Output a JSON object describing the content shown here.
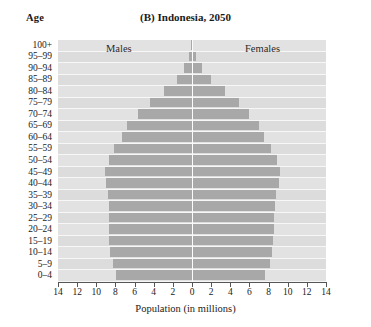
{
  "axes": {
    "age_label": "Age",
    "x_title": "Population (in millions)",
    "x_ticks": [
      "14",
      "12",
      "10",
      "8",
      "6",
      "4",
      "2",
      "0",
      "2",
      "4",
      "6",
      "8",
      "10",
      "12",
      "14"
    ]
  },
  "title": {
    "panel": "(B)",
    "text": "Indonesia, 2050",
    "full": "(B) Indonesia, 2050"
  },
  "legend": {
    "males": "Males",
    "females": "Females"
  },
  "colors": {
    "bar": "#a8a8a8",
    "plot_background": "#e2e2e2",
    "plot_background_alt": "#dcdcdc",
    "center_line": "#fbfbfb",
    "axis": "#555555",
    "text": "#1a1a1a"
  },
  "chart_data": {
    "type": "bar",
    "subtype": "population-pyramid",
    "xlabel": "Population (in millions)",
    "ylabel": "Age",
    "xlim": [
      -14,
      14
    ],
    "x_ticks_absolute": [
      14,
      12,
      10,
      8,
      6,
      4,
      2,
      0,
      2,
      4,
      6,
      8,
      10,
      12,
      14
    ],
    "grid": false,
    "legend_position": "inside-top",
    "categories": [
      "100+",
      "95–99",
      "90–94",
      "85–89",
      "80–84",
      "75–79",
      "70–74",
      "65–69",
      "60–64",
      "55–59",
      "50–54",
      "45–49",
      "40–44",
      "35–39",
      "30–34",
      "25–29",
      "20–24",
      "15–19",
      "10–14",
      "5–9",
      "0–4"
    ],
    "series": [
      {
        "name": "Males",
        "direction": "left",
        "values": [
          0.1,
          0.3,
          0.8,
          1.6,
          2.9,
          4.4,
          5.6,
          6.8,
          7.3,
          8.1,
          8.7,
          9.1,
          9.0,
          8.8,
          8.7,
          8.7,
          8.7,
          8.7,
          8.6,
          8.3,
          7.9
        ]
      },
      {
        "name": "Females",
        "direction": "right",
        "values": [
          0.1,
          0.4,
          1.0,
          2.0,
          3.4,
          4.9,
          6.0,
          7.0,
          7.5,
          8.3,
          8.9,
          9.2,
          9.1,
          8.8,
          8.7,
          8.6,
          8.6,
          8.5,
          8.4,
          8.1,
          7.6
        ]
      }
    ]
  }
}
